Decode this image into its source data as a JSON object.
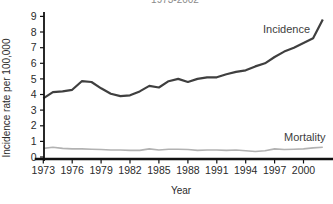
{
  "chart_data": {
    "type": "line",
    "title": "1973-2002",
    "title_note": "title is clipped at top edge of screenshot, only bottom of digits visible",
    "xlabel": "Year",
    "ylabel": "Incidence rate per 100,000",
    "xlim": [
      1973,
      2002
    ],
    "ylim": [
      0,
      9
    ],
    "x_ticks": [
      1973,
      1976,
      1979,
      1982,
      1985,
      1988,
      1991,
      1994,
      1997,
      2000
    ],
    "y_ticks": [
      0,
      1,
      2,
      3,
      4,
      5,
      6,
      7,
      8,
      9
    ],
    "grid": false,
    "legend_position": "inline-labels",
    "axis_color": "#111111",
    "x": [
      1973,
      1974,
      1975,
      1976,
      1977,
      1978,
      1979,
      1980,
      1981,
      1982,
      1983,
      1984,
      1985,
      1986,
      1987,
      1988,
      1989,
      1990,
      1991,
      1992,
      1993,
      1994,
      1995,
      1996,
      1997,
      1998,
      1999,
      2000,
      2001,
      2002
    ],
    "series": [
      {
        "name": "Incidence",
        "color": "#3f3f3f",
        "values": [
          3.75,
          4.15,
          4.2,
          4.3,
          4.85,
          4.8,
          4.4,
          4.05,
          3.9,
          3.95,
          4.2,
          4.55,
          4.45,
          4.85,
          5.0,
          4.8,
          5.0,
          5.1,
          5.1,
          5.3,
          5.45,
          5.55,
          5.8,
          6.0,
          6.4,
          6.75,
          7.0,
          7.3,
          7.6,
          8.8
        ]
      },
      {
        "name": "Mortality",
        "color": "#b2b2b2",
        "values": [
          0.55,
          0.62,
          0.55,
          0.52,
          0.52,
          0.5,
          0.48,
          0.45,
          0.45,
          0.42,
          0.42,
          0.52,
          0.45,
          0.5,
          0.5,
          0.48,
          0.42,
          0.45,
          0.45,
          0.42,
          0.45,
          0.4,
          0.35,
          0.4,
          0.52,
          0.48,
          0.5,
          0.52,
          0.58,
          0.62
        ]
      }
    ]
  }
}
